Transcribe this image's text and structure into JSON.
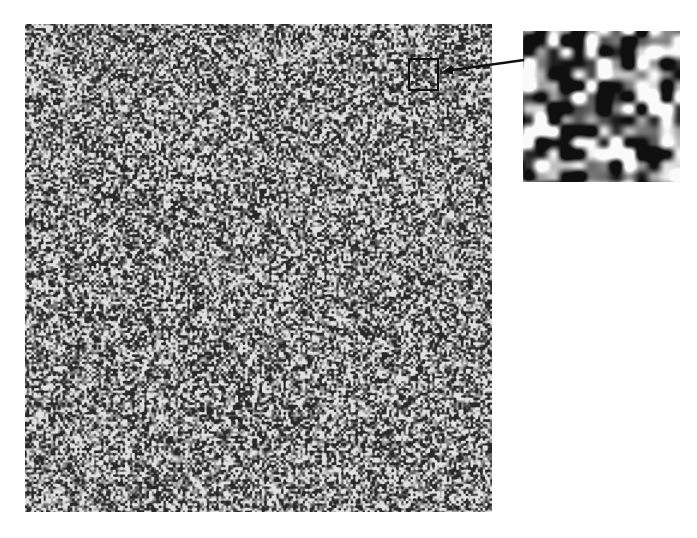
{
  "figure": {
    "main_panel": {
      "name": "speckle-pattern",
      "x": 25,
      "y": 24,
      "width": 467,
      "height": 488,
      "mean_gray": "#777777",
      "grain_px": 2.5
    },
    "zoom_region": {
      "x": 408,
      "y": 58,
      "width": 30,
      "height": 32,
      "border_color": "#111111"
    },
    "inset": {
      "name": "magnified-speckle",
      "x": 523,
      "y": 31,
      "width": 157,
      "height": 151
    },
    "arrow": {
      "from": [
        524,
        60
      ],
      "to": [
        441,
        72
      ],
      "color": "#111111"
    },
    "colors": {
      "background": "#ffffff",
      "dark": "#111111",
      "light": "#f2f2f2"
    }
  }
}
